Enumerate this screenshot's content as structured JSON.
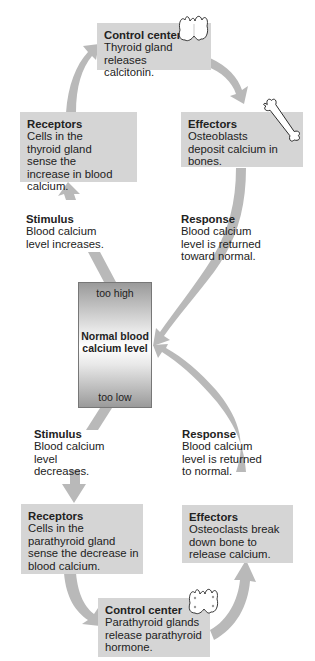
{
  "colors": {
    "box_fill": "#d5d5d5",
    "arrow_fill": "#b9b9b9",
    "text": "#222222"
  },
  "top_loop": {
    "control_center": {
      "title": "Control center",
      "body": "Thyroid gland releases calcitonin.",
      "icon": "thyroid-gland-icon"
    },
    "effectors": {
      "title": "Effectors",
      "body": "Osteoblasts deposit calcium in bones.",
      "icon": "bone-icon"
    },
    "receptors": {
      "title": "Receptors",
      "body": "Cells in the thyroid gland sense the increase in blood calcium."
    },
    "stimulus": {
      "title": "Stimulus",
      "body": "Blood calcium level increases."
    },
    "response": {
      "title": "Response",
      "body": "Blood calcium level is returned toward normal."
    }
  },
  "center": {
    "too_high": "too high",
    "normal": "Normal blood calcium level",
    "too_low": "too low"
  },
  "bottom_loop": {
    "stimulus": {
      "title": "Stimulus",
      "body": "Blood calcium level decreases."
    },
    "response": {
      "title": "Response",
      "body": "Blood calcium level is returned to normal."
    },
    "receptors": {
      "title": "Receptors",
      "body": "Cells in the parathyroid gland sense the decrease in blood calcium."
    },
    "effectors": {
      "title": "Effectors",
      "body": "Osteoclasts break down bone to release calcium."
    },
    "control_center": {
      "title": "Control center",
      "body": "Parathyroid glands release parathyroid hormone.",
      "icon": "parathyroid-glands-icon"
    }
  }
}
